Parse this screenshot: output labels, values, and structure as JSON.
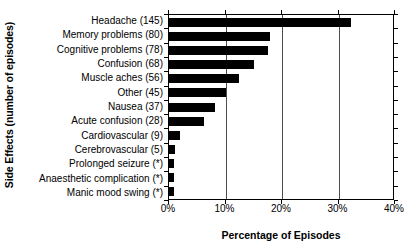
{
  "chart_data": {
    "type": "bar",
    "orientation": "horizontal",
    "title": "",
    "xlabel": "Percentage of Episodes",
    "ylabel": "Side Effects (number of episodes)",
    "categories": [
      "Headache (145)",
      "Memory problems (80)",
      "Cognitive problems (78)",
      "Cerebrovascular (5)",
      "Confusion (68)",
      "Muscle aches (56)",
      "Other (45)",
      "Nausea (37)",
      "Acute confusion (28)",
      "Cardiovascular (9)",
      "Prolonged seizure (*)",
      "Anaesthetic complication (*)",
      "Manic mood swing (*)"
    ],
    "category_order": [
      "Headache (145)",
      "Memory problems (80)",
      "Cognitive problems (78)",
      "Confusion (68)",
      "Muscle aches (56)",
      "Other (45)",
      "Nausea (37)",
      "Acute confusion (28)",
      "Cardiovascular (9)",
      "Cerebrovascular (5)",
      "Prolonged seizure (*)",
      "Anaesthetic complication (*)",
      "Manic mood swing (*)"
    ],
    "values": [
      32.3,
      17.8,
      17.6,
      15.1,
      12.4,
      10.0,
      8.2,
      6.2,
      2.0,
      1.1,
      0.9,
      0.9,
      0.9
    ],
    "counts": [
      145,
      80,
      78,
      68,
      56,
      45,
      37,
      28,
      9,
      5,
      null,
      null,
      null
    ],
    "value_unit": "%",
    "xlim": [
      0,
      40
    ],
    "xticks": [
      0,
      10,
      20,
      30,
      40
    ],
    "xtick_labels": [
      "0%",
      "10%",
      "20%",
      "30%",
      "40%"
    ],
    "grid": true,
    "grid_axis": "x",
    "legend": null,
    "bar_color": "#000000",
    "background_color": "#ffffff",
    "footnote_marker": "(*)"
  },
  "axes": {
    "y_title": "Side Effects (number of episodes)",
    "x_title": "Percentage of Episodes"
  },
  "bars": [
    {
      "label": "Headache (145)",
      "value": 32.3,
      "count": "145"
    },
    {
      "label": "Memory problems (80)",
      "value": 17.8,
      "count": "80"
    },
    {
      "label": "Cognitive problems (78)",
      "value": 17.6,
      "count": "78"
    },
    {
      "label": "Confusion (68)",
      "value": 15.1,
      "count": "68"
    },
    {
      "label": "Muscle aches (56)",
      "value": 12.4,
      "count": "56"
    },
    {
      "label": "Other (45)",
      "value": 10.0,
      "count": "45"
    },
    {
      "label": "Nausea (37)",
      "value": 8.2,
      "count": "37"
    },
    {
      "label": "Acute confusion (28)",
      "value": 6.2,
      "count": "28"
    },
    {
      "label": "Cardiovascular (9)",
      "value": 2.0,
      "count": "9"
    },
    {
      "label": "Cerebrovascular (5)",
      "value": 1.1,
      "count": "5"
    },
    {
      "label": "Prolonged seizure (*)",
      "value": 0.9,
      "count": "*"
    },
    {
      "label": "Anaesthetic complication (*)",
      "value": 0.9,
      "count": "*"
    },
    {
      "label": "Manic mood swing (*)",
      "value": 0.9,
      "count": "*"
    }
  ],
  "xticks": [
    {
      "label": "0%",
      "value": 0
    },
    {
      "label": "10%",
      "value": 10
    },
    {
      "label": "20%",
      "value": 20
    },
    {
      "label": "30%",
      "value": 30
    },
    {
      "label": "40%",
      "value": 40
    }
  ]
}
